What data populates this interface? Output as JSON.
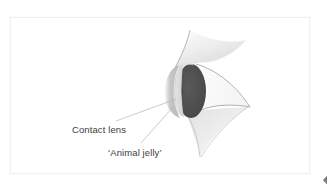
{
  "figure": {
    "kind": "anatomical-illustration",
    "labels": [
      {
        "id": "contact_lens",
        "text": "Contact lens"
      },
      {
        "id": "animal_jelly",
        "text": "‘Animal jelly’"
      }
    ],
    "parts": [
      {
        "id": "upper_eyelid",
        "name": "upper eyelid",
        "color": "#e8e8e8"
      },
      {
        "id": "lower_eyelid",
        "name": "lower eyelid",
        "color": "#ededed"
      },
      {
        "id": "contact_lens_shell",
        "name": "contact lens",
        "color": "#c9c9c9"
      },
      {
        "id": "jelly_layer",
        "name": "animal jelly layer",
        "color": "#dcdcdc"
      },
      {
        "id": "eyeball",
        "name": "eyeball / cornea",
        "color": "#4d4d4d"
      },
      {
        "id": "pupil",
        "name": "pupil",
        "color": "#111111"
      }
    ],
    "colors": {
      "background": "#ffffff",
      "frame_border": "#f0f0f0",
      "leader_line": "#b4b4b4",
      "text": "#3d3d3d",
      "eyeball_dark": "#4d4d4d",
      "lens_grey": "#c9c9c9",
      "eyelid_grey": "#e8e8e8",
      "page_curl": "#5c5c5c"
    },
    "leader_lines": [
      {
        "id": "leader_contact_lens",
        "from": [
          116,
          121
        ],
        "to": [
          176,
          100
        ]
      },
      {
        "id": "leader_animal_jelly",
        "from": [
          140,
          144
        ],
        "to": [
          172,
          108
        ]
      }
    ]
  }
}
